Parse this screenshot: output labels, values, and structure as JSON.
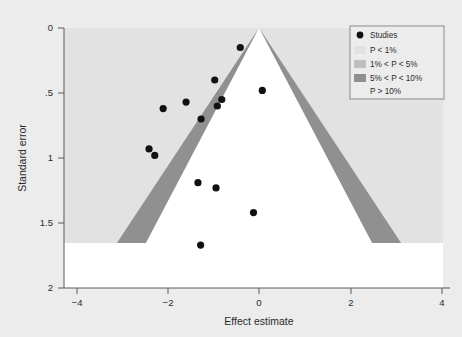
{
  "figure": {
    "background_color": "#ececec",
    "plot_background_color": "#ffffff",
    "width": 462,
    "height": 337
  },
  "legend": {
    "title": "",
    "position": "top-right",
    "border_color": "#8a8a8a",
    "background_color": "#ececec",
    "entries": [
      {
        "marker": "dot",
        "label": "Studies",
        "color": "#111111"
      },
      {
        "marker": "swatch",
        "label": "P < 1%",
        "color": "#e2e2e2"
      },
      {
        "marker": "swatch",
        "label": "1% < P < 5%",
        "color": "#c0c0c0"
      },
      {
        "marker": "swatch",
        "label": "5% < P < 10%",
        "color": "#909090"
      },
      {
        "marker": "none",
        "label": "P > 10%",
        "color": "#ffffff"
      }
    ]
  },
  "chart_data": {
    "type": "scatter",
    "chart_subtype": "contour-enhanced-funnel-plot",
    "title": "",
    "subtitle": "",
    "xlabel": "Effect estimate",
    "ylabel": "Standard error",
    "xlim": [
      -4.3,
      4.3
    ],
    "ylim": [
      2,
      0
    ],
    "y_axis_inverted": true,
    "grid": false,
    "xticks": [
      -4,
      -2,
      0,
      2,
      4
    ],
    "xticklabels": [
      "−4",
      "−2",
      "0",
      "2",
      "4"
    ],
    "yticks": [
      0,
      0.5,
      1,
      1.5,
      2
    ],
    "yticklabels": [
      "0",
      ".5",
      "1",
      "1.5",
      "2"
    ],
    "legend_position": "upper right",
    "series": [
      {
        "name": "Studies",
        "marker": "circle",
        "color": "#111111",
        "x": [
          -0.3,
          -0.88,
          -1.53,
          -2.05,
          -0.72,
          -0.82,
          -1.19,
          -2.37,
          -2.24,
          -1.26,
          -0.85,
          0.2,
          0.0,
          -1.2
        ],
        "y": [
          0.15,
          0.4,
          0.57,
          0.62,
          0.55,
          0.6,
          0.7,
          0.93,
          0.98,
          1.19,
          1.23,
          0.48,
          1.42,
          1.67
        ]
      }
    ],
    "contours": {
      "apex": {
        "x": 0.0,
        "y": 0.0
      },
      "max_se": 1.67,
      "regions": [
        {
          "label": "P < 1%",
          "color": "#e2e2e2",
          "z": 2.576,
          "side": "outer"
        },
        {
          "label": "1% < P < 5%",
          "color": "#c0c0c0",
          "z_low": 1.96,
          "z_high": 2.576
        },
        {
          "label": "5% < P < 10%",
          "color": "#909090",
          "z_low": 1.645,
          "z_high": 1.96
        },
        {
          "label": "P > 10%",
          "color": "#ffffff",
          "z": 1.645,
          "side": "inner"
        }
      ]
    }
  }
}
